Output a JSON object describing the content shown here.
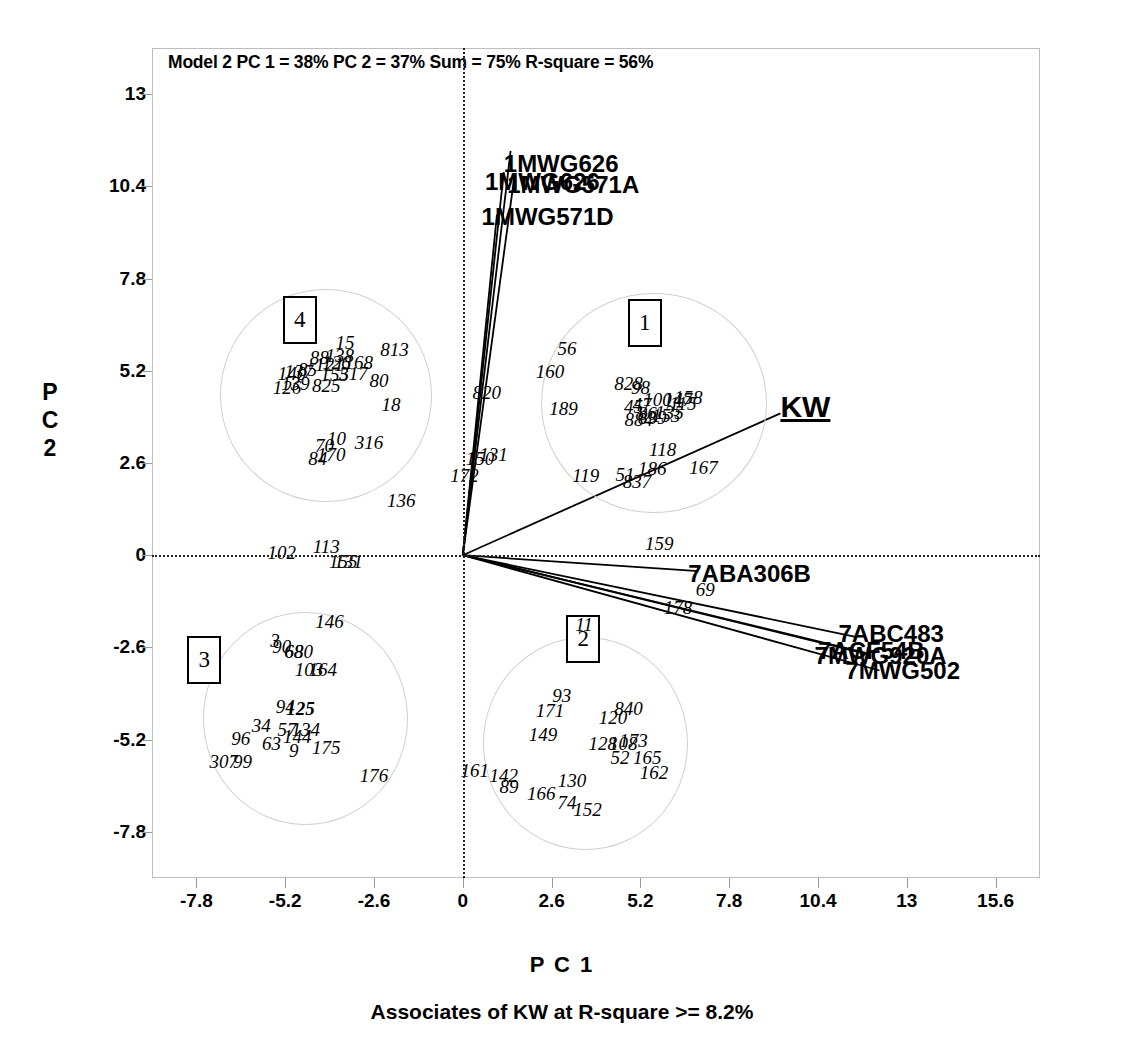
{
  "chart_data": {
    "type": "scatter",
    "title": "Model 2 PC 1 = 38% PC 2 = 37% Sum = 75% R-square =  56%",
    "caption": "Associates of KW at R-square >= 8.2%",
    "xlabel": "P C 1",
    "ylabel_chars": [
      "P",
      "C",
      "2"
    ],
    "xlim": [
      -9.1,
      16.9
    ],
    "ylim": [
      -9.1,
      14.3
    ],
    "xticks": [
      "-7.8",
      "-5.2",
      "-2.6",
      "0",
      "2.6",
      "5.2",
      "7.8",
      "10.4",
      "13",
      "15.6"
    ],
    "xtick_values": [
      -7.8,
      -5.2,
      -2.6,
      0,
      2.6,
      5.2,
      7.8,
      10.4,
      13,
      15.6
    ],
    "yticks": [
      "13",
      "10.4",
      "7.8",
      "5.2",
      "2.6",
      "0",
      "-2.6",
      "-5.2",
      "-7.8"
    ],
    "ytick_values": [
      13,
      10.4,
      7.8,
      5.2,
      2.6,
      0,
      -2.6,
      -5.2,
      -7.8
    ],
    "grid": false,
    "zero_lines": true,
    "legend": "none",
    "clusters": [
      {
        "id": "1",
        "label": "1",
        "center": [
          5.6,
          4.3
        ],
        "rx": 3.3,
        "ry": 3.1,
        "box_x": 5.3,
        "box_y": 6.6
      },
      {
        "id": "2",
        "label": "2",
        "center": [
          3.6,
          -5.3
        ],
        "rx": 3.0,
        "ry": 3.0,
        "box_x": 3.5,
        "box_y": -2.3
      },
      {
        "id": "3",
        "label": "3",
        "center": [
          -4.6,
          -4.6
        ],
        "rx": 3.0,
        "ry": 3.0,
        "box_x": -7.6,
        "box_y": -2.9
      },
      {
        "id": "4",
        "label": "4",
        "center": [
          -4.0,
          4.5
        ],
        "rx": 3.1,
        "ry": 3.0,
        "box_x": -4.8,
        "box_y": 6.7
      }
    ],
    "vectors": [
      {
        "name": "1MWG626",
        "x": 1.4,
        "y": 11.4,
        "label_x": 1.2,
        "label_y": 11.0
      },
      {
        "name": "1MWG571A",
        "x": 1.5,
        "y": 10.6,
        "label_x": 1.3,
        "label_y": 10.4
      },
      {
        "name": "1MWG626b",
        "x": 1.2,
        "y": 10.8,
        "label_x": 0.65,
        "label_y": 10.5
      },
      {
        "name": "1MWG571D",
        "x": 1.0,
        "y": 9.6,
        "label_x": 0.55,
        "label_y": 9.5
      },
      {
        "name": "KW",
        "x": 9.3,
        "y": 4.0,
        "label_x": 9.3,
        "label_y": 4.1
      },
      {
        "name": "7ABA306B",
        "x": 6.9,
        "y": -0.45,
        "label_x": 6.6,
        "label_y": -0.55
      },
      {
        "name": "7ABC483",
        "x": 11.5,
        "y": -2.3,
        "label_x": 11.0,
        "label_y": -2.25
      },
      {
        "name": "7ACF54B",
        "x": 11.8,
        "y": -2.75,
        "label_x": 10.4,
        "label_y": -2.72
      },
      {
        "name": "7MWG920A",
        "x": 11.9,
        "y": -2.8,
        "label_x": 10.3,
        "label_y": -2.88
      },
      {
        "name": "7MWG502",
        "x": 12.2,
        "y": -3.25,
        "label_x": 11.2,
        "label_y": -3.3
      }
    ],
    "points": [
      {
        "t": "56",
        "x": 3.05,
        "y": 5.85
      },
      {
        "t": "160",
        "x": 2.55,
        "y": 5.2
      },
      {
        "t": "189",
        "x": 2.95,
        "y": 4.15
      },
      {
        "t": "828",
        "x": 4.85,
        "y": 4.85
      },
      {
        "t": "98",
        "x": 5.2,
        "y": 4.75
      },
      {
        "t": "100",
        "x": 5.7,
        "y": 4.4
      },
      {
        "t": "147",
        "x": 6.3,
        "y": 4.4
      },
      {
        "t": "158",
        "x": 6.6,
        "y": 4.45
      },
      {
        "t": "45",
        "x": 5.0,
        "y": 4.2
      },
      {
        "t": "47",
        "x": 5.25,
        "y": 4.25
      },
      {
        "t": "115",
        "x": 6.45,
        "y": 4.3
      },
      {
        "t": "135",
        "x": 6.05,
        "y": 4.05
      },
      {
        "t": "86",
        "x": 5.4,
        "y": 4.0
      },
      {
        "t": "884",
        "x": 5.15,
        "y": 3.85
      },
      {
        "t": "839",
        "x": 5.55,
        "y": 3.9
      },
      {
        "t": "153",
        "x": 5.95,
        "y": 3.95
      },
      {
        "t": "118",
        "x": 5.85,
        "y": 3.0
      },
      {
        "t": "186",
        "x": 5.55,
        "y": 2.45
      },
      {
        "t": "167",
        "x": 7.05,
        "y": 2.5
      },
      {
        "t": "51",
        "x": 4.75,
        "y": 2.3
      },
      {
        "t": "837",
        "x": 5.1,
        "y": 2.1
      },
      {
        "t": "119",
        "x": 3.6,
        "y": 2.25
      },
      {
        "t": "159",
        "x": 5.75,
        "y": 0.35
      },
      {
        "t": "69",
        "x": 7.1,
        "y": -0.95
      },
      {
        "t": "178",
        "x": 6.3,
        "y": -1.45
      },
      {
        "t": "15",
        "x": -3.45,
        "y": 6.0
      },
      {
        "t": "813",
        "x": -2.0,
        "y": 5.8
      },
      {
        "t": "138",
        "x": -3.6,
        "y": 5.65
      },
      {
        "t": "88",
        "x": -4.2,
        "y": 5.6
      },
      {
        "t": "168",
        "x": -3.05,
        "y": 5.45
      },
      {
        "t": "126",
        "x": -3.7,
        "y": 5.45
      },
      {
        "t": "121",
        "x": -3.9,
        "y": 5.4
      },
      {
        "t": "317",
        "x": -3.2,
        "y": 5.15
      },
      {
        "t": "155",
        "x": -3.75,
        "y": 5.1
      },
      {
        "t": "85",
        "x": -4.55,
        "y": 5.25
      },
      {
        "t": "137",
        "x": -4.8,
        "y": 5.2
      },
      {
        "t": "140",
        "x": -5.0,
        "y": 5.15
      },
      {
        "t": "80",
        "x": -2.45,
        "y": 4.95
      },
      {
        "t": "825",
        "x": -4.0,
        "y": 4.8
      },
      {
        "t": "126b",
        "x": -5.15,
        "y": 4.75
      },
      {
        "t": "139",
        "x": -4.9,
        "y": 4.85
      },
      {
        "t": "18",
        "x": -2.1,
        "y": 4.25
      },
      {
        "t": "316",
        "x": -2.75,
        "y": 3.2
      },
      {
        "t": "10",
        "x": -3.7,
        "y": 3.3
      },
      {
        "t": "70",
        "x": -4.05,
        "y": 3.1
      },
      {
        "t": "170",
        "x": -3.85,
        "y": 2.85
      },
      {
        "t": "84",
        "x": -4.25,
        "y": 2.75
      },
      {
        "t": "820",
        "x": 0.7,
        "y": 4.6
      },
      {
        "t": "150",
        "x": 0.5,
        "y": 2.75
      },
      {
        "t": "131",
        "x": 0.9,
        "y": 2.85
      },
      {
        "t": "172",
        "x": 0.05,
        "y": 2.25
      },
      {
        "t": "136",
        "x": -1.8,
        "y": 1.55
      },
      {
        "t": "102",
        "x": -5.3,
        "y": 0.1
      },
      {
        "t": "113",
        "x": -4.0,
        "y": 0.25
      },
      {
        "t": "155b",
        "x": -3.5,
        "y": -0.15
      },
      {
        "t": "131b",
        "x": -3.35,
        "y": -0.15
      },
      {
        "t": "146",
        "x": -3.9,
        "y": -1.85
      },
      {
        "t": "90",
        "x": -5.3,
        "y": -2.55
      },
      {
        "t": "3",
        "x": -5.5,
        "y": -2.4
      },
      {
        "t": "680",
        "x": -4.8,
        "y": -2.7
      },
      {
        "t": "68",
        "x": -4.95,
        "y": -2.7
      },
      {
        "t": "103",
        "x": -4.5,
        "y": -3.2
      },
      {
        "t": "164",
        "x": -4.1,
        "y": -3.2
      },
      {
        "t": "94",
        "x": -5.2,
        "y": -4.25
      },
      {
        "t": "125",
        "x": -4.75,
        "y": -4.3
      },
      {
        "t": "34",
        "x": -5.9,
        "y": -4.8
      },
      {
        "t": "57",
        "x": -5.15,
        "y": -4.9
      },
      {
        "t": "134",
        "x": -4.6,
        "y": -4.9
      },
      {
        "t": "144",
        "x": -4.85,
        "y": -5.1
      },
      {
        "t": "96",
        "x": -6.5,
        "y": -5.15
      },
      {
        "t": "63",
        "x": -5.6,
        "y": -5.3
      },
      {
        "t": "9",
        "x": -4.95,
        "y": -5.5
      },
      {
        "t": "175",
        "x": -4.0,
        "y": -5.4
      },
      {
        "t": "307",
        "x": -7.0,
        "y": -5.8
      },
      {
        "t": "99",
        "x": -6.45,
        "y": -5.8
      },
      {
        "t": "176",
        "x": -2.6,
        "y": -6.2
      },
      {
        "t": "93",
        "x": 2.9,
        "y": -3.95
      },
      {
        "t": "171",
        "x": 2.55,
        "y": -4.35
      },
      {
        "t": "840",
        "x": 4.85,
        "y": -4.3
      },
      {
        "t": "120",
        "x": 4.4,
        "y": -4.55
      },
      {
        "t": "149",
        "x": 2.35,
        "y": -5.05
      },
      {
        "t": "128",
        "x": 4.1,
        "y": -5.3
      },
      {
        "t": "108",
        "x": 4.7,
        "y": -5.3
      },
      {
        "t": "173",
        "x": 5.0,
        "y": -5.2
      },
      {
        "t": "52",
        "x": 4.6,
        "y": -5.7
      },
      {
        "t": "165",
        "x": 5.4,
        "y": -5.7
      },
      {
        "t": "162",
        "x": 5.6,
        "y": -6.1
      },
      {
        "t": "161",
        "x": 0.35,
        "y": -6.05
      },
      {
        "t": "142",
        "x": 1.2,
        "y": -6.2
      },
      {
        "t": "89",
        "x": 1.35,
        "y": -6.5
      },
      {
        "t": "130",
        "x": 3.2,
        "y": -6.35
      },
      {
        "t": "166",
        "x": 2.3,
        "y": -6.7
      },
      {
        "t": "152",
        "x": 3.65,
        "y": -7.15
      },
      {
        "t": "74",
        "x": 3.05,
        "y": -6.95
      },
      {
        "t": "11",
        "x": 3.55,
        "y": -1.95
      }
    ]
  }
}
